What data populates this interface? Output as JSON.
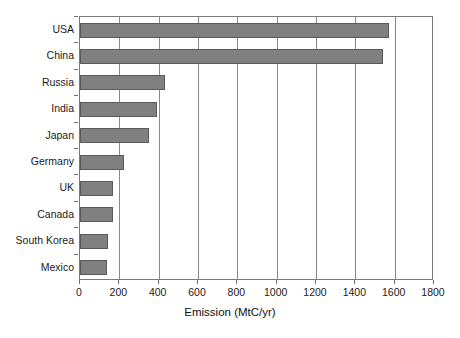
{
  "chart_data": {
    "type": "bar",
    "orientation": "horizontal",
    "title": "",
    "xlabel": "Emission (MtC/yr)",
    "ylabel": "",
    "categories": [
      "USA",
      "China",
      "Russia",
      "India",
      "Japan",
      "Germany",
      "UK",
      "Canada",
      "South Korea",
      "Mexico"
    ],
    "values": [
      1570,
      1540,
      430,
      390,
      350,
      225,
      168,
      168,
      142,
      137
    ],
    "xlim": [
      0,
      1800
    ],
    "ylim": null,
    "xticks": [
      0,
      200,
      400,
      600,
      800,
      1000,
      1200,
      1400,
      1600,
      1800
    ],
    "xtick_labels": [
      "0",
      "200",
      "400",
      "600",
      "800",
      "1000",
      "1200",
      "1400",
      "1600",
      "1800"
    ],
    "grid": "vertical",
    "legend": null,
    "series": [
      {
        "name": "Emission",
        "values": [
          1570,
          1540,
          430,
          390,
          350,
          225,
          168,
          168,
          142,
          137
        ]
      }
    ],
    "colors": {
      "bar_fill": "#808080",
      "bar_edge": "#5a5a5a",
      "grid": "#8a8a8a",
      "axis": "#7a7a7a",
      "text": "#1b1b1b",
      "background": "#ffffff"
    }
  }
}
